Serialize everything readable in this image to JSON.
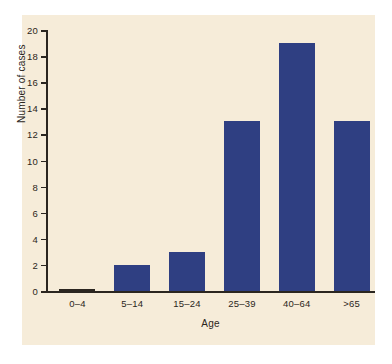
{
  "chart_data": {
    "type": "bar",
    "title": "",
    "xlabel": "Age",
    "ylabel": "Number of cases",
    "categories": [
      "0–4",
      "5–14",
      "15–24",
      "25–39",
      "40–64",
      ">65"
    ],
    "values": [
      0,
      2,
      3,
      13,
      19,
      13
    ],
    "ylim": [
      0,
      20
    ],
    "yticks": [
      0,
      2,
      4,
      6,
      8,
      10,
      12,
      14,
      16,
      18,
      20
    ],
    "ytick_labels": [
      "0",
      "2",
      "4",
      "6",
      "8",
      "10",
      "12",
      "14",
      "16",
      "18",
      "20"
    ],
    "grid": false,
    "legend": null,
    "bar_color": "#2f3f82",
    "panel_color": "#f6ecd9",
    "axis_color": "#2b2620",
    "page_color": "#ffffff"
  }
}
